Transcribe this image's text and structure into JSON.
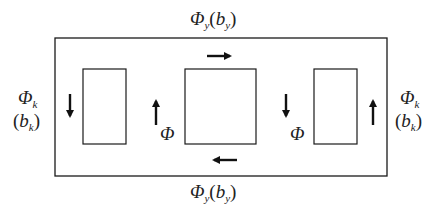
{
  "diagram": {
    "type": "magnetic-circuit-schematic",
    "outer_frame": {
      "x": 55,
      "y": 38,
      "w": 332,
      "h": 138
    },
    "windows": [
      {
        "name": "left-window",
        "x": 83,
        "y": 69,
        "w": 43,
        "h": 75
      },
      {
        "name": "center-window",
        "x": 185,
        "y": 69,
        "w": 71,
        "h": 75
      },
      {
        "name": "right-window",
        "x": 314,
        "y": 69,
        "w": 43,
        "h": 75
      }
    ],
    "arrows": [
      {
        "name": "top-flux-arrow",
        "direction": "right"
      },
      {
        "name": "bottom-flux-arrow",
        "direction": "left"
      },
      {
        "name": "left-limb-arrow",
        "direction": "down"
      },
      {
        "name": "center-left-arrow",
        "direction": "up"
      },
      {
        "name": "center-right-arrow",
        "direction": "down"
      },
      {
        "name": "right-limb-arrow",
        "direction": "up"
      }
    ],
    "labels": {
      "top_yoke": {
        "symbol": "Φ",
        "sub": "y",
        "paren_symbol": "b",
        "paren_sub": "y"
      },
      "bottom_yoke": {
        "symbol": "Φ",
        "sub": "y",
        "paren_symbol": "b",
        "paren_sub": "y"
      },
      "left_limb": {
        "symbol": "Φ",
        "sub": "k",
        "paren_symbol": "b",
        "paren_sub": "k"
      },
      "right_limb": {
        "symbol": "Φ",
        "sub": "k",
        "paren_symbol": "b",
        "paren_sub": "k"
      },
      "center_left_flux": "Φ",
      "center_right_flux": "Φ"
    },
    "paren_open": "(",
    "paren_close": ")",
    "line_color": "#1a1a1a",
    "arrow_color": "#111111"
  }
}
